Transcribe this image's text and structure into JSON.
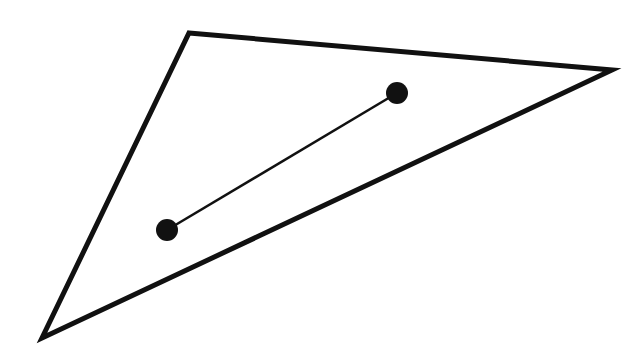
{
  "diagram": {
    "background": "#ffffff",
    "stroke_color": "#111111",
    "triangle": {
      "vertices": [
        [
          189,
          33
        ],
        [
          612,
          70
        ],
        [
          42,
          338
        ]
      ],
      "stroke_width": 5
    },
    "segment": {
      "start": [
        167,
        230
      ],
      "end": [
        397,
        93
      ],
      "stroke_width": 2.5,
      "endpoint_radius": 11
    }
  }
}
